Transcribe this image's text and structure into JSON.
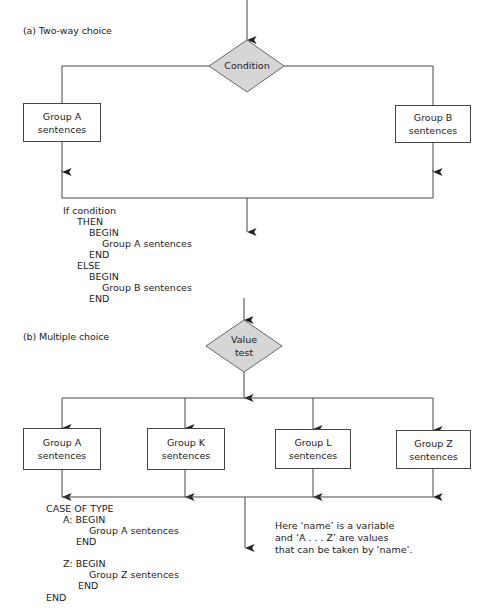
{
  "part_a": {
    "title": "(a) Two-way choice",
    "decision": "Condition",
    "boxes": [
      {
        "line1": "Group A",
        "line2": "sentences"
      },
      {
        "line1": "Group B",
        "line2": "sentences"
      }
    ],
    "code": [
      "If condition",
      "THEN",
      "BEGIN",
      "Group A sentences",
      "END",
      "ELSE",
      "BEGIN",
      "Group B sentences",
      "END"
    ]
  },
  "part_b": {
    "title": "(b) Multiple choice",
    "decision": {
      "line1": "Value",
      "line2": "test"
    },
    "boxes": [
      {
        "line1": "Group A",
        "line2": "sentences"
      },
      {
        "line1": "Group K",
        "line2": "sentences"
      },
      {
        "line1": "Group L",
        "line2": "sentences"
      },
      {
        "line1": "Group Z",
        "line2": "sentences"
      }
    ],
    "code": [
      "CASE OF TYPE",
      "A: BEGIN",
      "Group A sentences",
      "END",
      "Z: BEGIN",
      "Group Z sentences",
      "END",
      "END"
    ],
    "note": [
      "Here ‘name’ is a variable",
      "and ‘A . . . Z’ are values",
      "that can be taken by ‘name’."
    ]
  },
  "colors": {
    "decision_fill": "#d6d6d6",
    "line": "#444444"
  }
}
